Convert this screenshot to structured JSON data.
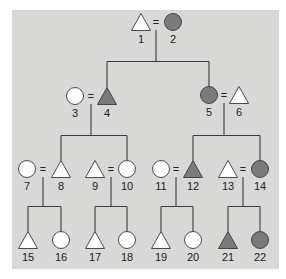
{
  "diagram": {
    "type": "pedigree",
    "colors": {
      "background": "#ffffff",
      "panel": "#d8d8d6",
      "affected_fill": "#7b7b7b",
      "unaffected_fill": "#ffffff",
      "line": "#3c3c3c"
    },
    "marriage_symbol": "=",
    "individuals": [
      {
        "id": "1",
        "shape": "triangle",
        "affected": false,
        "generation": 1,
        "cx": 141,
        "cy": 22
      },
      {
        "id": "2",
        "shape": "circle",
        "affected": true,
        "generation": 1,
        "cx": 173,
        "cy": 22
      },
      {
        "id": "3",
        "shape": "circle",
        "affected": false,
        "generation": 2,
        "cx": 75,
        "cy": 96
      },
      {
        "id": "4",
        "shape": "triangle",
        "affected": true,
        "generation": 2,
        "cx": 107,
        "cy": 96
      },
      {
        "id": "5",
        "shape": "circle",
        "affected": true,
        "generation": 2,
        "cx": 209,
        "cy": 95
      },
      {
        "id": "6",
        "shape": "triangle",
        "affected": false,
        "generation": 2,
        "cx": 239,
        "cy": 95
      },
      {
        "id": "7",
        "shape": "circle",
        "affected": false,
        "generation": 3,
        "cx": 27,
        "cy": 169
      },
      {
        "id": "8",
        "shape": "triangle",
        "affected": false,
        "generation": 3,
        "cx": 61,
        "cy": 169
      },
      {
        "id": "9",
        "shape": "triangle",
        "affected": false,
        "generation": 3,
        "cx": 95,
        "cy": 169
      },
      {
        "id": "10",
        "shape": "circle",
        "affected": false,
        "generation": 3,
        "cx": 127,
        "cy": 169
      },
      {
        "id": "11",
        "shape": "circle",
        "affected": false,
        "generation": 3,
        "cx": 161,
        "cy": 169
      },
      {
        "id": "12",
        "shape": "triangle",
        "affected": true,
        "generation": 3,
        "cx": 193,
        "cy": 169
      },
      {
        "id": "13",
        "shape": "triangle",
        "affected": false,
        "generation": 3,
        "cx": 228,
        "cy": 169
      },
      {
        "id": "14",
        "shape": "circle",
        "affected": true,
        "generation": 3,
        "cx": 260,
        "cy": 169
      },
      {
        "id": "15",
        "shape": "triangle",
        "affected": false,
        "generation": 4,
        "cx": 28,
        "cy": 240
      },
      {
        "id": "16",
        "shape": "circle",
        "affected": false,
        "generation": 4,
        "cx": 61,
        "cy": 240
      },
      {
        "id": "17",
        "shape": "triangle",
        "affected": false,
        "generation": 4,
        "cx": 95,
        "cy": 240
      },
      {
        "id": "18",
        "shape": "circle",
        "affected": false,
        "generation": 4,
        "cx": 127,
        "cy": 240
      },
      {
        "id": "19",
        "shape": "triangle",
        "affected": false,
        "generation": 4,
        "cx": 161,
        "cy": 240
      },
      {
        "id": "20",
        "shape": "circle",
        "affected": false,
        "generation": 4,
        "cx": 193,
        "cy": 240
      },
      {
        "id": "21",
        "shape": "triangle",
        "affected": true,
        "generation": 4,
        "cx": 228,
        "cy": 240
      },
      {
        "id": "22",
        "shape": "circle",
        "affected": true,
        "generation": 4,
        "cx": 260,
        "cy": 240
      }
    ],
    "couples": [
      {
        "partners": [
          "1",
          "2"
        ],
        "eq_x": 156,
        "eq_y": 22,
        "children": [
          "4",
          "5"
        ]
      },
      {
        "partners": [
          "3",
          "4"
        ],
        "eq_x": 91,
        "eq_y": 96,
        "children": [
          "8",
          "10"
        ]
      },
      {
        "partners": [
          "5",
          "6"
        ],
        "eq_x": 224,
        "eq_y": 95,
        "children": [
          "12",
          "14"
        ]
      },
      {
        "partners": [
          "7",
          "8"
        ],
        "eq_x": 43,
        "eq_y": 169,
        "children": [
          "15",
          "16"
        ]
      },
      {
        "partners": [
          "9",
          "10"
        ],
        "eq_x": 111,
        "eq_y": 169,
        "children": [
          "17",
          "18"
        ]
      },
      {
        "partners": [
          "11",
          "12"
        ],
        "eq_x": 176,
        "eq_y": 169,
        "children": [
          "19",
          "20"
        ]
      },
      {
        "partners": [
          "13",
          "14"
        ],
        "eq_x": 243,
        "eq_y": 169,
        "children": [
          "21",
          "22"
        ]
      }
    ]
  }
}
